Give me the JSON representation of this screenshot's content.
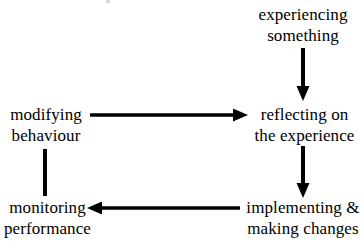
{
  "diagram": {
    "background_color": "#ffffff",
    "stroke_color": "#000000",
    "text_color": "#000000",
    "nodes": [
      {
        "id": "experiencing-something",
        "line1": "experiencing",
        "line2": "something"
      },
      {
        "id": "reflecting-on-the-experience",
        "line1": "reflecting on",
        "line2": "the experience"
      },
      {
        "id": "implementing-making-changes",
        "line1": "implementing &",
        "line2": "making changes"
      },
      {
        "id": "monitoring-performance",
        "line1": "monitoring",
        "line2": "performance"
      },
      {
        "id": "modifying-behaviour",
        "line1": "modifying",
        "line2": "behaviour"
      }
    ],
    "connectors": [
      {
        "id": "experiencing-to-reflecting",
        "from": "experiencing-something",
        "to": "reflecting-on-the-experience",
        "direction": "down",
        "arrowhead": "yes"
      },
      {
        "id": "reflecting-to-implementing",
        "from": "reflecting-on-the-experience",
        "to": "implementing-making-changes",
        "direction": "down",
        "arrowhead": "yes"
      },
      {
        "id": "implementing-to-monitoring",
        "from": "implementing-making-changes",
        "to": "monitoring-performance",
        "direction": "left",
        "arrowhead": "yes"
      },
      {
        "id": "monitoring-to-modifying",
        "from": "monitoring-performance",
        "to": "modifying-behaviour",
        "direction": "up",
        "arrowhead": "no"
      },
      {
        "id": "modifying-to-reflecting",
        "from": "modifying-behaviour",
        "to": "reflecting-on-the-experience",
        "direction": "right",
        "arrowhead": "yes"
      }
    ]
  }
}
